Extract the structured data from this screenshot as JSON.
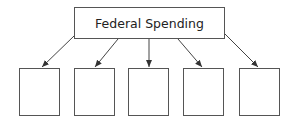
{
  "diagram": {
    "root": {
      "label": "Federal Spending"
    },
    "children": [
      {
        "label": ""
      },
      {
        "label": ""
      },
      {
        "label": ""
      },
      {
        "label": ""
      },
      {
        "label": ""
      }
    ],
    "colors": {
      "stroke": "#555555",
      "background": "#ffffff",
      "text": "#222222"
    }
  }
}
